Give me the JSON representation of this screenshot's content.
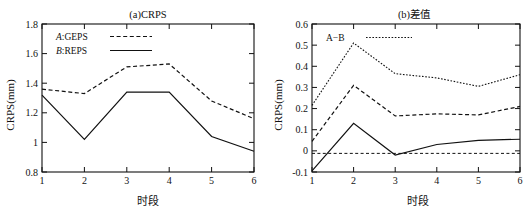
{
  "figure": {
    "panels": [
      "a",
      "b"
    ]
  },
  "chart_data": [
    {
      "type": "line",
      "panel": "a",
      "title": "(a)CRPS",
      "xlabel": "时段",
      "ylabel": "CRPS(mm)",
      "x": [
        1,
        2,
        3,
        4,
        5,
        6
      ],
      "xticklabels": [
        "1",
        "2",
        "3",
        "4",
        "5",
        "6"
      ],
      "xlim": [
        1,
        6
      ],
      "ylim": [
        0.8,
        1.8
      ],
      "yticks": [
        0.8,
        1.0,
        1.2,
        1.4,
        1.6,
        1.8
      ],
      "yticklabels": [
        "0.8",
        "1",
        "1.2",
        "1.4",
        "1.6",
        "1.8"
      ],
      "grid": false,
      "legend_position": "top-left",
      "series": [
        {
          "name": "A:GEPS",
          "label_italic_prefix": "A",
          "label_rest": ":GEPS",
          "style": "dashed",
          "values": [
            1.36,
            1.33,
            1.51,
            1.53,
            1.28,
            1.16
          ]
        },
        {
          "name": "B:REPS",
          "label_italic_prefix": "B",
          "label_rest": ":REPS",
          "style": "solid",
          "values": [
            1.32,
            1.02,
            1.34,
            1.34,
            1.04,
            0.94
          ]
        }
      ]
    },
    {
      "type": "line",
      "panel": "b",
      "title": "(b)差值",
      "xlabel": "时段",
      "ylabel": "CRPS(mm)",
      "x": [
        1,
        2,
        3,
        4,
        5,
        6
      ],
      "xticklabels": [
        "1",
        "2",
        "3",
        "4",
        "5",
        "6"
      ],
      "xlim": [
        1,
        6
      ],
      "ylim": [
        -0.1,
        0.6
      ],
      "yticks": [
        -0.1,
        0.0,
        0.1,
        0.2,
        0.3,
        0.4,
        0.5,
        0.6
      ],
      "yticklabels": [
        "-0.1",
        "0",
        "0.1",
        "0.2",
        "0.3",
        "0.4",
        "0.5",
        "0.6"
      ],
      "grid": false,
      "legend_position": "top-left",
      "legend_label": "A−B",
      "series": [
        {
          "name": "upper-bound",
          "style": "dotted",
          "values": [
            0.215,
            0.51,
            0.365,
            0.345,
            0.305,
            0.36
          ]
        },
        {
          "name": "A-B",
          "style": "dashed",
          "values": [
            0.045,
            0.31,
            0.165,
            0.175,
            0.17,
            0.21
          ]
        },
        {
          "name": "lower-bound",
          "style": "solid",
          "values": [
            -0.095,
            0.13,
            -0.02,
            0.03,
            0.05,
            0.055
          ]
        },
        {
          "name": "zero-reference",
          "style": "dashed-thin",
          "values": [
            -0.012,
            -0.012,
            -0.012,
            -0.012,
            -0.012,
            -0.012
          ]
        }
      ]
    }
  ]
}
